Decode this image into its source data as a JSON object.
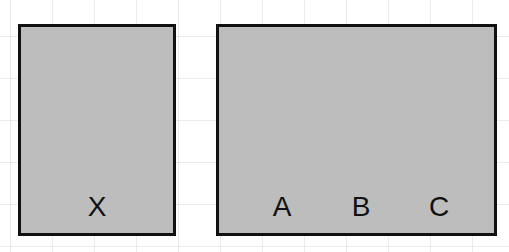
{
  "diagram": {
    "boxes": [
      {
        "id": "left",
        "labels": [
          "X"
        ],
        "fill": "#bdbdbd",
        "border": "#111111"
      },
      {
        "id": "right",
        "labels": [
          "A",
          "B",
          "C"
        ],
        "fill": "#bdbdbd",
        "border": "#111111"
      }
    ],
    "background": {
      "grid": true,
      "grid_color": "#e0e0e0"
    }
  }
}
